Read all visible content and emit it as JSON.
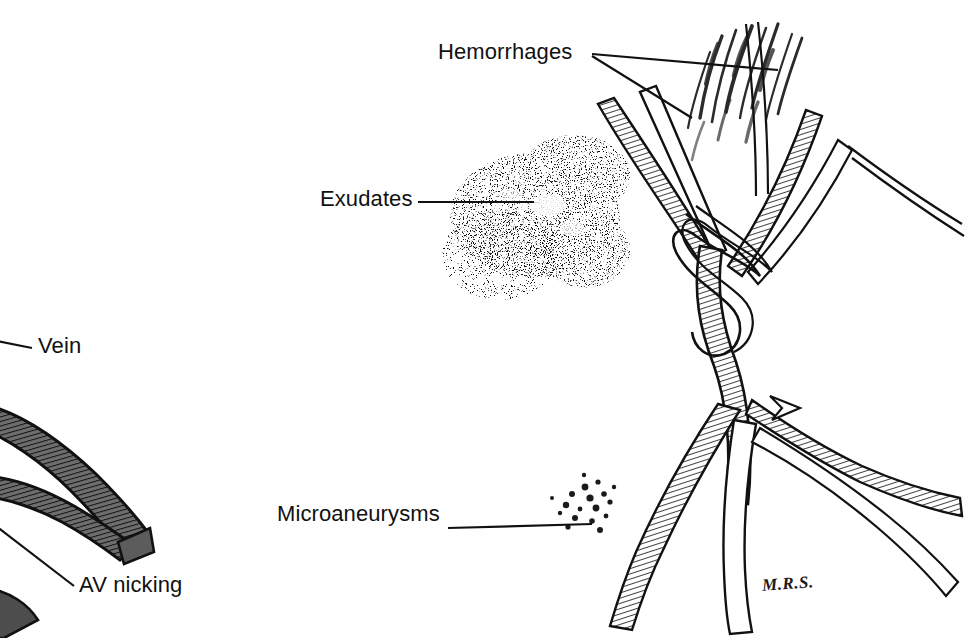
{
  "figure": {
    "background_color": "#ffffff",
    "ink_color": "#111111",
    "width": 965,
    "height": 638
  },
  "labels": {
    "hemorrhages": "Hemorrhages",
    "exudates": "Exudates",
    "microaneurysms": "Microaneurysms",
    "vein": "Vein",
    "av_nicking": "AV nicking"
  },
  "signature": {
    "text": "M.R.S."
  },
  "panels": {
    "left": {
      "name": "av-nicking-detail",
      "features": [
        "vein",
        "av_nicking"
      ]
    },
    "right": {
      "name": "fundus-overview",
      "features": [
        "hemorrhages",
        "exudates",
        "microaneurysms",
        "optic_disc",
        "retinal_vessels"
      ]
    }
  }
}
